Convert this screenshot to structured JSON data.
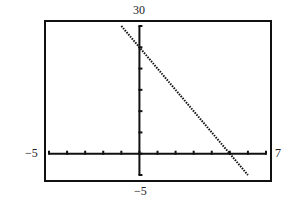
{
  "chart_data": {
    "type": "line",
    "title": "",
    "xlabel": "",
    "ylabel": "",
    "xlim": [
      -5,
      7
    ],
    "ylim": [
      -5,
      30
    ],
    "xscale": 1,
    "yscale": 5,
    "grid": false,
    "series": [
      {
        "name": "y = 25 - 5x",
        "x": [
          -1,
          6
        ],
        "y": [
          30,
          -5
        ],
        "style": "dotted"
      }
    ],
    "window_labels": {
      "ymax": "30",
      "ymin": "−5",
      "xmin": "−5",
      "xmax": "7"
    }
  },
  "colors": {
    "ink": "#111111",
    "background": "#ffffff"
  }
}
